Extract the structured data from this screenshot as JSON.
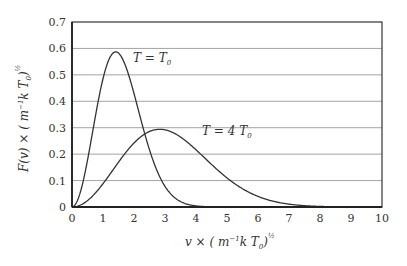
{
  "chart_data": {
    "type": "line",
    "title": "",
    "xlabel": "v × (m⁻¹ k T₀)^½",
    "ylabel": "F(v) × (m⁻¹ k T₀)^½",
    "xlim": [
      0,
      10
    ],
    "ylim": [
      0,
      0.7
    ],
    "x_ticks": [
      "0",
      "1",
      "2",
      "3",
      "4",
      "5",
      "6",
      "7",
      "8",
      "9",
      "10"
    ],
    "y_ticks": [
      "0",
      "0.1",
      "0.2",
      "0.3",
      "0.4",
      "0.5",
      "0.6",
      "0.7"
    ],
    "grid": "horizontal",
    "x": [
      0,
      0.5,
      1,
      1.5,
      2,
      2.5,
      3,
      3.5,
      4,
      4.5,
      5,
      5.5,
      6,
      6.5,
      7,
      7.5,
      8,
      8.5,
      9,
      9.5,
      10
    ],
    "series": [
      {
        "name": "T = T₀",
        "values": [
          0,
          0.176,
          0.484,
          0.583,
          0.432,
          0.219,
          0.08,
          0.021,
          0.004,
          0.0005,
          0,
          0,
          0,
          0,
          0,
          0,
          0,
          0,
          0,
          0,
          0
        ],
        "peak": {
          "x": 1.41,
          "y": 0.587
        }
      },
      {
        "name": "T = 4 T₀",
        "values": [
          0,
          0.024,
          0.088,
          0.169,
          0.242,
          0.285,
          0.291,
          0.264,
          0.216,
          0.161,
          0.109,
          0.069,
          0.04,
          0.021,
          0.011,
          0.005,
          0.002,
          0.0008,
          0.0003,
          0.0001,
          0
        ],
        "peak": {
          "x": 2.83,
          "y": 0.294
        }
      }
    ],
    "annotations": [
      {
        "text": "T = T₀",
        "x": 2.0,
        "y": 0.56
      },
      {
        "text": "T = 4 T₀",
        "x": 4.2,
        "y": 0.29
      }
    ]
  },
  "labels": {
    "xlabel_main": "v × ( m",
    "xlabel_exp": "−1",
    "xlabel_tail": "k T",
    "xlabel_sub": "0",
    "xlabel_close": ")",
    "xlabel_pow": "½",
    "ylabel_main": "F(v) × ( m",
    "ylabel_exp": "−1",
    "ylabel_tail": "k T",
    "ylabel_sub": "0",
    "ylabel_close": ")",
    "ylabel_pow": "½",
    "ann1_main": "T = T",
    "ann1_sub": "0",
    "ann2_main": "T = 4 T",
    "ann2_sub": "0"
  }
}
